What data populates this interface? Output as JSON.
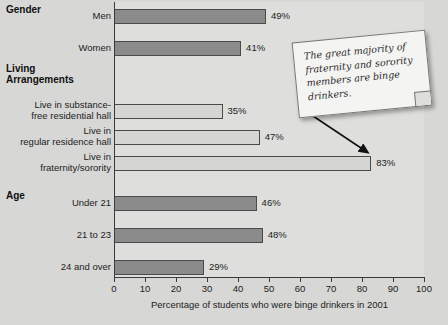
{
  "chart_data": {
    "type": "bar",
    "orientation": "horizontal",
    "title": "",
    "xlabel": "Percentage of students who were binge drinkers in 2001",
    "ylabel": "",
    "xlim": [
      0,
      100
    ],
    "xticks": [
      0,
      10,
      20,
      30,
      40,
      50,
      60,
      70,
      80,
      90,
      100
    ],
    "xtick_labels": [
      "0",
      "10",
      "20",
      "30",
      "40",
      "50",
      "60",
      "70",
      "80",
      "90",
      "100"
    ],
    "grid": false,
    "legend": "none",
    "groups": [
      {
        "name": "Gender",
        "bars": [
          {
            "category": "Men",
            "value": 49,
            "label": "49%",
            "style": "dark"
          },
          {
            "category": "Women",
            "value": 41,
            "label": "41%",
            "style": "dark"
          }
        ]
      },
      {
        "name": "Living Arrangements",
        "bars": [
          {
            "category": "Live in substance-free residential hall",
            "value": 35,
            "label": "35%",
            "style": "light"
          },
          {
            "category": "Live in regular residence hall",
            "value": 47,
            "label": "47%",
            "style": "light"
          },
          {
            "category": "Live in fraternity/sorority",
            "value": 83,
            "label": "83%",
            "style": "light"
          }
        ]
      },
      {
        "name": "Age",
        "bars": [
          {
            "category": "Under 21",
            "value": 46,
            "label": "46%",
            "style": "dark"
          },
          {
            "category": "21 to 23",
            "value": 48,
            "label": "48%",
            "style": "dark"
          },
          {
            "category": "24 and over",
            "value": 29,
            "label": "29%",
            "style": "dark"
          }
        ]
      }
    ],
    "categories": [
      "Men",
      "Women",
      "Live in substance-free residential hall",
      "Live in regular residence hall",
      "Live in fraternity/sorority",
      "Under 21",
      "21 to 23",
      "24 and over"
    ],
    "values": [
      49,
      41,
      35,
      47,
      83,
      46,
      48,
      29
    ],
    "value_labels": [
      "49%",
      "41%",
      "35%",
      "47%",
      "83%",
      "46%",
      "48%",
      "29%"
    ],
    "annotations": [
      {
        "text": "The great majority of fraternity and sorority members are binge drinkers.",
        "points_to": "Live in fraternity/sorority"
      }
    ],
    "colors": {
      "background": "#d7d7d5",
      "plot_background": "#dededc",
      "bar_dark": "#8b8b8b",
      "bar_light": "#d5d5d3",
      "bar_outline": "#4a4a4a",
      "axis": "#3a3a3a",
      "text": "#1c1c1c",
      "callout_background": "#f4f4f2"
    }
  },
  "group_headings": {
    "gender": "Gender",
    "living_line1": "Living",
    "living_line2": "Arrangements",
    "age": "Age"
  },
  "category_labels": {
    "men": "Men",
    "women": "Women",
    "substance_line1": "Live in substance-",
    "substance_line2": "free residential hall",
    "regular_line1": "Live in",
    "regular_line2": "regular residence hall",
    "frat_line1": "Live in",
    "frat_line2": "fraternity/sorority",
    "under21": "Under 21",
    "age21to23": "21 to 23",
    "age24over": "24 and over"
  },
  "value_labels": {
    "men": "49%",
    "women": "41%",
    "substance": "35%",
    "regular": "47%",
    "frat": "83%",
    "under21": "46%",
    "age21to23": "48%",
    "age24over": "29%"
  },
  "axis": {
    "title": "Percentage of students who were binge drinkers in 2001",
    "t0": "0",
    "t10": "10",
    "t20": "20",
    "t30": "30",
    "t40": "40",
    "t50": "50",
    "t60": "60",
    "t70": "70",
    "t80": "80",
    "t90": "90",
    "t100": "100"
  },
  "callout": {
    "text": "The great majority of fraternity and sorority members are binge drinkers."
  }
}
